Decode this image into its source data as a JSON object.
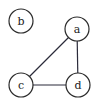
{
  "diagram": {
    "type": "undirected-graph",
    "colors": {
      "background": "#ffffff",
      "node_stroke": "#2b2b2b",
      "edge_stroke": "#2b2b3a",
      "label": "#222222"
    },
    "nodes": [
      {
        "id": "a",
        "label": "a",
        "cx": 77,
        "cy": 29,
        "r": 12
      },
      {
        "id": "b",
        "label": "b",
        "cx": 21,
        "cy": 21,
        "r": 12
      },
      {
        "id": "c",
        "label": "c",
        "cx": 21,
        "cy": 85,
        "r": 12
      },
      {
        "id": "d",
        "label": "d",
        "cx": 78,
        "cy": 85,
        "r": 12
      }
    ],
    "edges": [
      {
        "from": "a",
        "to": "c"
      },
      {
        "from": "a",
        "to": "d"
      },
      {
        "from": "c",
        "to": "d"
      }
    ]
  }
}
